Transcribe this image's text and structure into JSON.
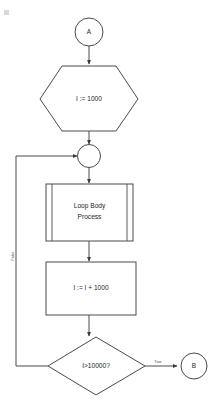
{
  "diagram": {
    "background_color": "#ffffff",
    "line_color": "#4a4a4a",
    "text_color": "#1d1d1d",
    "nodes": {
      "start_connector": {
        "label": "A",
        "shape": "connector-circle"
      },
      "init": {
        "label": "I := 1000",
        "shape": "preparation-hexagon"
      },
      "junction": {
        "label": "",
        "shape": "junction-circle"
      },
      "loop_body": {
        "label_line1": "Loop Body",
        "label_line2": "Process",
        "shape": "predefined-process"
      },
      "increment": {
        "label": "I := I + 1000",
        "shape": "process-rectangle"
      },
      "decision": {
        "label": "I>10000?",
        "shape": "decision-diamond"
      },
      "end_connector": {
        "label": "B",
        "shape": "connector-circle"
      }
    },
    "edge_labels": {
      "true_branch": "True",
      "false_branch": "False"
    }
  }
}
